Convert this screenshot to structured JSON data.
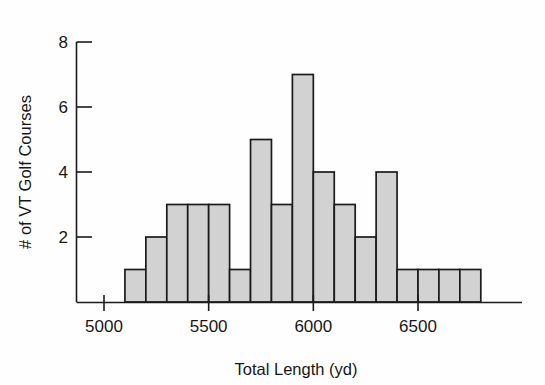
{
  "chart_data": {
    "type": "bar",
    "title": "",
    "xlabel": "Total Length (yd)",
    "ylabel": "# of VT Golf Courses",
    "bin_width": 100,
    "bin_starts": [
      5100,
      5200,
      5300,
      5400,
      5500,
      5600,
      5700,
      5800,
      5900,
      6000,
      6100,
      6200,
      6300,
      6400,
      6500,
      6600,
      6700
    ],
    "categories": [
      "5100-5200",
      "5200-5300",
      "5300-5400",
      "5400-5500",
      "5500-5600",
      "5600-5700",
      "5700-5800",
      "5800-5900",
      "5900-6000",
      "6000-6100",
      "6100-6200",
      "6200-6300",
      "6300-6400",
      "6400-6500",
      "6500-6600",
      "6600-6700",
      "6700-6800"
    ],
    "values": [
      1,
      2,
      3,
      3,
      3,
      1,
      5,
      3,
      7,
      4,
      3,
      2,
      4,
      1,
      1,
      1,
      1
    ],
    "xlim": [
      5000,
      6800
    ],
    "ylim": [
      0,
      8
    ],
    "xticks": [
      5000,
      5500,
      6000,
      6500
    ],
    "xtick_labels": [
      "5000",
      "5500",
      "6000",
      "6500"
    ],
    "yticks": [
      2,
      4,
      6,
      8
    ],
    "ytick_labels": [
      "2",
      "4",
      "6",
      "8"
    ],
    "grid": false,
    "legend": false,
    "bar_fill_color": "#d2d2d2",
    "bar_edge_color": "#1b1b1b",
    "axis_color": "#1b1b1b",
    "background_color": "#fefefe",
    "total_count": 37
  }
}
